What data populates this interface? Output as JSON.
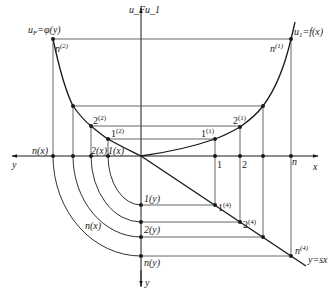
{
  "diagram": {
    "title": "",
    "colors": {
      "line": "#1a1a1a",
      "guide": "#555555",
      "background": "#ffffff"
    },
    "axes": {
      "top_label": "u_F | u_1",
      "top_label_left": "u_F",
      "top_label_right": "u_1",
      "x_label": "x",
      "y_left_label": "y",
      "y_bottom_label": "y"
    },
    "curves": {
      "left": "u_F = φ(y)",
      "left_lhs": "u",
      "left_sub": "F",
      "left_rhs": "=φ(y)",
      "right": "u_1 = f(x)",
      "right_lhs": "u",
      "right_sub": "1",
      "right_rhs": "=f(x)",
      "diagonal": "y=sx"
    },
    "points": {
      "n2": {
        "base": "n",
        "sup": "(2)"
      },
      "n1": {
        "base": "n",
        "sup": "(1)"
      },
      "two2": {
        "base": "2",
        "sup": "(2)"
      },
      "one2": {
        "base": "1",
        "sup": "(2)"
      },
      "one1": {
        "base": "1",
        "sup": "(1)"
      },
      "two1": {
        "base": "2",
        "sup": "(1)"
      },
      "one4": {
        "base": "1",
        "sup": "(4)"
      },
      "two4": {
        "base": "2",
        "sup": "(4)"
      },
      "n4": {
        "base": "n",
        "sup": "(4)"
      }
    },
    "x_axis_labels": {
      "one": "1",
      "two": "2",
      "n": "n"
    },
    "left_axis_labels": {
      "nx": "n(x)",
      "twox": "2(x)",
      "onex": "1(x)"
    },
    "bottom_axis_labels": {
      "oney": "1(y)",
      "twoy": "2(y)",
      "ny": "n(y)"
    },
    "arc_label": "n(x)"
  }
}
